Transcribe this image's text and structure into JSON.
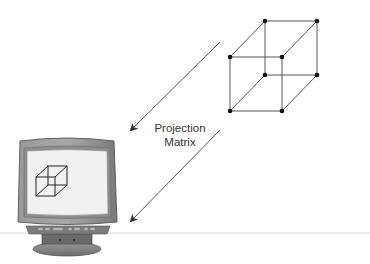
{
  "diagram": {
    "label": {
      "line1": "Projection",
      "line2": "Matrix"
    },
    "colors": {
      "line": "#555555",
      "vertex": "#111111",
      "monitor_bezel": "#8a8a8a",
      "monitor_screen": "#f2f2f2",
      "baseline": "#e6e6e6"
    },
    "elements": [
      "3d-wireframe-cube",
      "projection-arrow-upper",
      "projection-arrow-lower",
      "crt-monitor-with-projected-cube"
    ]
  }
}
